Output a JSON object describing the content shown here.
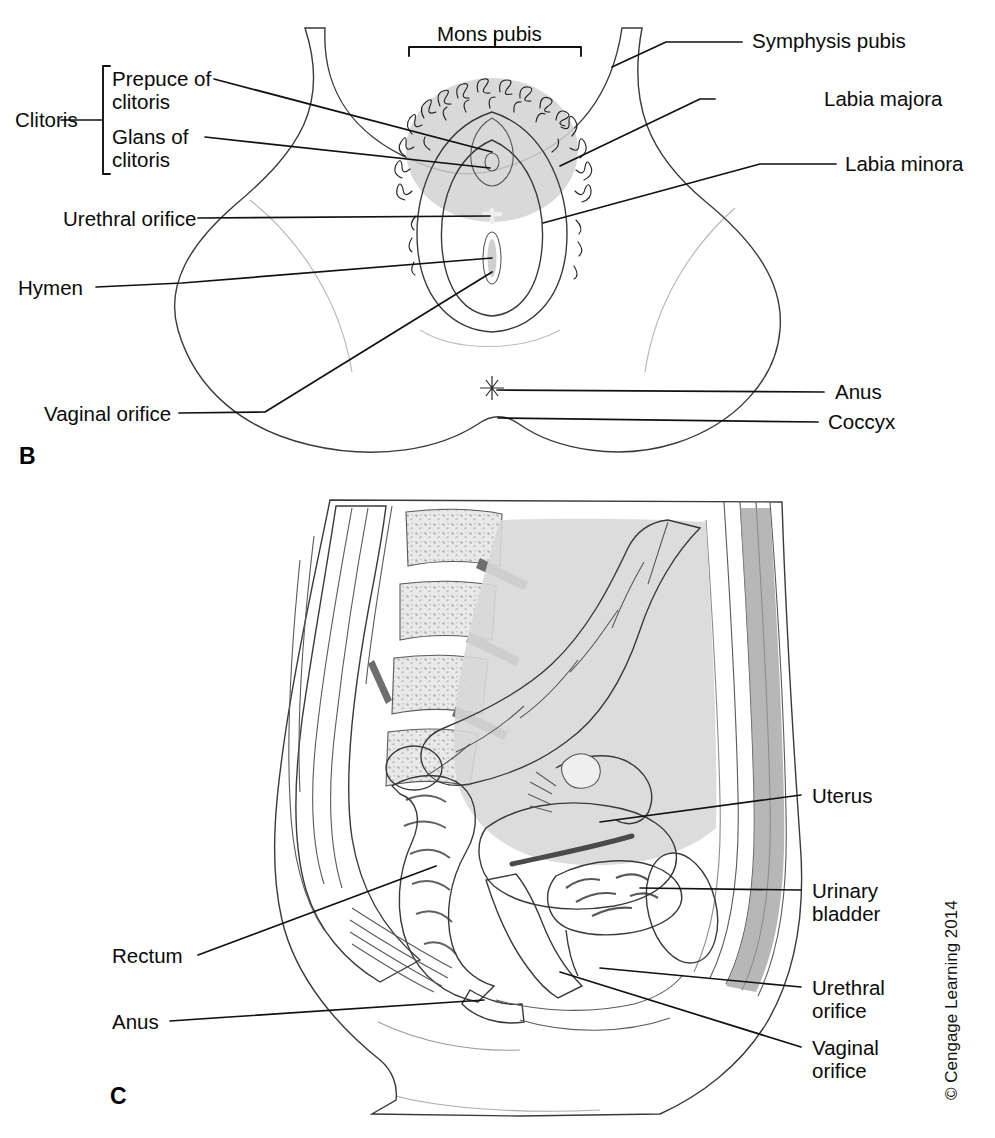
{
  "figure": {
    "copyright": "© Cengage Learning 2014",
    "background_color": "#ffffff",
    "ink_color": "#111111",
    "skin_tone": "#dcdcdc",
    "tissue_mid": "#b9b9b9",
    "tissue_dark": "#8d8d8d",
    "tissue_darkest": "#5e5e5e"
  },
  "panels": [
    {
      "id": "panel-b",
      "letter": "B",
      "caption_view": "External female genitalia, anterior view",
      "labels": [
        {
          "key": "mons_pubis",
          "text": "Mons pubis",
          "side": "top"
        },
        {
          "key": "symphysis_pubis",
          "text": "Symphysis pubis",
          "side": "right"
        },
        {
          "key": "labia_majora",
          "text": "Labia majora",
          "side": "right"
        },
        {
          "key": "labia_minora",
          "text": "Labia minora",
          "side": "right"
        },
        {
          "key": "anus",
          "text": "Anus",
          "side": "right"
        },
        {
          "key": "coccyx",
          "text": "Coccyx",
          "side": "right"
        },
        {
          "key": "clitoris_group",
          "text": "Clitoris",
          "side": "left"
        },
        {
          "key": "prepuce_line1",
          "text": "Prepuce of",
          "side": "left"
        },
        {
          "key": "prepuce_line2",
          "text": "clitoris",
          "side": "left"
        },
        {
          "key": "glans_line1",
          "text": "Glans of",
          "side": "left"
        },
        {
          "key": "glans_line2",
          "text": "clitoris",
          "side": "left"
        },
        {
          "key": "urethral_orifice",
          "text": "Urethral orifice",
          "side": "left"
        },
        {
          "key": "hymen",
          "text": "Hymen",
          "side": "left"
        },
        {
          "key": "vaginal_orifice",
          "text": "Vaginal orifice",
          "side": "left"
        }
      ]
    },
    {
      "id": "panel-c",
      "letter": "C",
      "caption_view": "Sagittal section of female pelvis",
      "labels": [
        {
          "key": "uterus",
          "text": "Uterus",
          "side": "right"
        },
        {
          "key": "urinary_line1",
          "text": "Urinary",
          "side": "right"
        },
        {
          "key": "urinary_line2",
          "text": "bladder",
          "side": "right"
        },
        {
          "key": "urethral_line1",
          "text": "Urethral",
          "side": "right"
        },
        {
          "key": "urethral_line2",
          "text": "orifice",
          "side": "right"
        },
        {
          "key": "vaginal_line1",
          "text": "Vaginal",
          "side": "right"
        },
        {
          "key": "vaginal_line2",
          "text": "orifice",
          "side": "right"
        },
        {
          "key": "rectum",
          "text": "Rectum",
          "side": "left"
        },
        {
          "key": "anus",
          "text": "Anus",
          "side": "left"
        }
      ]
    }
  ]
}
